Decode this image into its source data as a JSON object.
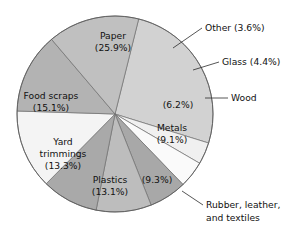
{
  "chart_data": {
    "type": "pie",
    "title": "",
    "subtitle": "",
    "xlabel": "",
    "ylabel": "",
    "legend_position": "callout-labels",
    "grid": false,
    "units": "percent",
    "total": 100,
    "center": {
      "x": 115,
      "y": 114
    },
    "radius": 98,
    "start_angle_deg": -76,
    "direction": "clockwise",
    "categories": [
      "Paper",
      "Other",
      "Glass",
      "Wood",
      "Metals",
      "Rubber, leather, and textiles",
      "Plastics",
      "Yard trimmings",
      "Food scraps"
    ],
    "values": [
      25.9,
      3.6,
      4.4,
      6.2,
      9.1,
      9.3,
      13.1,
      13.3,
      15.1
    ],
    "slices": [
      {
        "name": "Paper",
        "label": "Paper",
        "value_label": "(25.9%)",
        "value": 25.9,
        "color": "#d2d2d2",
        "label_mode": "inside",
        "label_x": 113,
        "label_y": 41
      },
      {
        "name": "Other",
        "label": "Other (3.6%)",
        "value_label": "(3.6%)",
        "value": 3.6,
        "color": "#f0f0f0",
        "label_mode": "callout",
        "label_x": 207,
        "label_y": 28,
        "leader_x1": 173,
        "leader_y1": 48,
        "leader_x2": 202,
        "leader_y2": 28
      },
      {
        "name": "Glass",
        "label": "Glass (4.4%)",
        "value_label": "(4.4%)",
        "value": 4.4,
        "color": "#fafafa",
        "label_mode": "callout",
        "label_x": 224,
        "label_y": 62,
        "leader_x1": 193,
        "leader_y1": 70,
        "leader_x2": 219,
        "leader_y2": 62
      },
      {
        "name": "Wood",
        "label": "Wood",
        "value_label": "(6.2%)",
        "value": 6.2,
        "color": "#a8a8a8",
        "label_mode": "callout-split",
        "label_x": 233,
        "label_y": 98,
        "value_x": 176,
        "value_y": 105,
        "leader_x1": 205,
        "leader_y1": 98,
        "leader_x2": 228,
        "leader_y2": 98
      },
      {
        "name": "Metals",
        "label": "Metals",
        "value_label": "(9.1%)",
        "value": 9.1,
        "color": "#bdbdbd",
        "label_mode": "inside",
        "label_x": 171,
        "label_y": 132
      },
      {
        "name": "Rubber, leather, and textiles",
        "label": "Rubber, leather,",
        "label_line2": "and textiles",
        "value_label": "(9.3%)",
        "value": 9.3,
        "color": "#a9a9a9",
        "label_mode": "callout-split",
        "label_x": 208,
        "label_y": 205,
        "label_x2": 208,
        "label_y2": 218,
        "value_x": 157,
        "value_y": 180,
        "leader_x1": 182,
        "leader_y1": 191,
        "leader_x2": 203,
        "leader_y2": 205
      },
      {
        "name": "Plastics",
        "label": "Plastics",
        "value_label": "(13.1%)",
        "value": 13.1,
        "color": "#f4f4f4",
        "label_mode": "inside",
        "label_x": 109,
        "label_y": 184
      },
      {
        "name": "Yard trimmings",
        "label": "Yard",
        "label_line2": "trimmings",
        "value_label": "(13.3%)",
        "value": 13.3,
        "color": "#b3b3b3",
        "label_mode": "inside",
        "label_x": 62,
        "label_y": 148
      },
      {
        "name": "Food scraps",
        "label": "Food scraps",
        "value_label": "(15.1%)",
        "value": 15.1,
        "color": "#c0c0c0",
        "label_mode": "inside",
        "label_x": 51,
        "label_y": 101
      }
    ]
  },
  "labels": {
    "paper_name": "Paper",
    "paper_value": "(25.9%)",
    "other_full": "Other (3.6%)",
    "glass_full": "Glass (4.4%)",
    "wood_name": "Wood",
    "wood_value": "(6.2%)",
    "metals_name": "Metals",
    "metals_value": "(9.1%)",
    "rubber_line1": "Rubber, leather,",
    "rubber_line2": "and textiles",
    "rubber_value": "(9.3%)",
    "plastics_name": "Plastics",
    "plastics_value": "(13.1%)",
    "yard_line1": "Yard",
    "yard_line2": "trimmings",
    "yard_value": "(13.3%)",
    "food_name": "Food scraps",
    "food_value": "(15.1%)"
  }
}
